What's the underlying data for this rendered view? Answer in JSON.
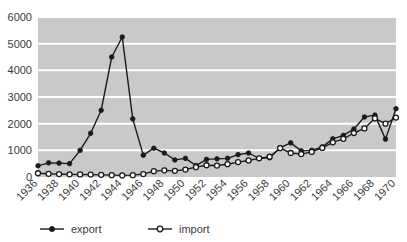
{
  "chart_data": {
    "type": "line",
    "title": "",
    "subtitle": "",
    "xlabel": "",
    "ylabel": "",
    "xlim": [
      1936,
      1970
    ],
    "ylim": [
      0,
      6000
    ],
    "ytick_step": 1000,
    "xtick_step": 2,
    "grid": true,
    "grid_color": "#ffffff",
    "plot_background": "#c9c9c9",
    "legend_position": "bottom",
    "x": [
      1936,
      1937,
      1938,
      1939,
      1940,
      1941,
      1942,
      1943,
      1944,
      1945,
      1946,
      1947,
      1948,
      1949,
      1950,
      1951,
      1952,
      1953,
      1954,
      1955,
      1956,
      1957,
      1958,
      1959,
      1960,
      1961,
      1962,
      1963,
      1964,
      1965,
      1966,
      1967,
      1968,
      1969,
      1970
    ],
    "yticks": [
      0,
      1000,
      2000,
      3000,
      4000,
      5000,
      6000
    ],
    "ytick_labels": [
      "0",
      "1000",
      "2000",
      "3000",
      "4000",
      "5000",
      "6000"
    ],
    "xticks": [
      1936,
      1938,
      1940,
      1942,
      1944,
      1946,
      1948,
      1950,
      1952,
      1954,
      1956,
      1958,
      1960,
      1962,
      1964,
      1966,
      1968,
      1970
    ],
    "xtick_labels": [
      "1936",
      "1938",
      "1940",
      "1942",
      "1944",
      "1946",
      "1948",
      "1950",
      "1952",
      "1954",
      "1956",
      "1958",
      "1960",
      "1962",
      "1964",
      "1966",
      "1968",
      "1970"
    ],
    "series": [
      {
        "name": "export",
        "marker": "filled-circle",
        "color": "#1a1a1a",
        "values": [
          420,
          530,
          520,
          500,
          1000,
          1640,
          2500,
          4500,
          5250,
          2180,
          820,
          1080,
          900,
          640,
          700,
          430,
          660,
          680,
          700,
          840,
          900,
          700,
          720,
          1100,
          1280,
          980,
          1000,
          1130,
          1430,
          1560,
          1800,
          2250,
          2320,
          1420,
          2560
        ]
      },
      {
        "name": "import",
        "marker": "hollow-circle",
        "color": "#1a1a1a",
        "values": [
          140,
          120,
          110,
          100,
          95,
          90,
          80,
          70,
          60,
          70,
          110,
          220,
          250,
          230,
          280,
          370,
          440,
          430,
          480,
          560,
          620,
          700,
          760,
          1080,
          900,
          860,
          940,
          1090,
          1300,
          1430,
          1650,
          1820,
          2200,
          2000,
          2230
        ]
      }
    ],
    "legend": [
      {
        "label": "export",
        "marker": "filled-circle"
      },
      {
        "label": "import",
        "marker": "hollow-circle"
      }
    ]
  }
}
